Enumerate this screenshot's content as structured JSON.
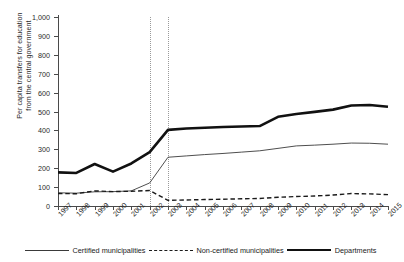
{
  "figure": {
    "title_cropped": "",
    "ylabel_line1": "Per capita transfers for education",
    "ylabel_line2": "from the central government"
  },
  "legend": {
    "items": [
      {
        "label": "Certified municipalities",
        "style": "thin-solid",
        "color": "#3a3a3a"
      },
      {
        "label": "Non-certified municipalities",
        "style": "dashed",
        "color": "#1a1a1a"
      },
      {
        "label": "Departments",
        "style": "thick-solid",
        "color": "#111111"
      }
    ]
  },
  "chart_data": {
    "type": "line",
    "title": "",
    "xlabel": "",
    "ylabel": "Per capita transfers for education from the central government",
    "x": [
      "1997",
      "1998",
      "1999",
      "2000",
      "2001",
      "2002",
      "2003",
      "2004",
      "2005",
      "2006",
      "2007",
      "2008",
      "2009",
      "2010",
      "2011",
      "2012",
      "2013",
      "2014",
      "2015"
    ],
    "xlim": [
      1997,
      2015
    ],
    "ylim": [
      0,
      1000
    ],
    "yticks": [
      0,
      100,
      200,
      300,
      400,
      500,
      600,
      700,
      800,
      900,
      1000
    ],
    "ytick_labels": [
      "0",
      "100",
      "200",
      "300",
      "400",
      "500",
      "600",
      "700",
      "800",
      "900",
      "1,000"
    ],
    "grid": false,
    "legend_position": "bottom",
    "annotations": [
      {
        "type": "vline",
        "x": "2002",
        "style": "dotted"
      },
      {
        "type": "vline",
        "x": "2003",
        "style": "dotted"
      }
    ],
    "series": [
      {
        "name": "Certified municipalities",
        "style": "thin-solid",
        "values": [
          70,
          68,
          75,
          76,
          80,
          122,
          258,
          265,
          272,
          278,
          285,
          292,
          305,
          318,
          322,
          327,
          333,
          332,
          327
        ]
      },
      {
        "name": "Non-certified municipalities",
        "style": "dashed",
        "values": [
          66,
          65,
          80,
          76,
          78,
          82,
          30,
          32,
          34,
          36,
          38,
          40,
          46,
          50,
          53,
          58,
          66,
          64,
          60
        ]
      },
      {
        "name": "Departments",
        "style": "thick-solid",
        "values": [
          178,
          175,
          222,
          182,
          225,
          285,
          403,
          410,
          414,
          418,
          421,
          423,
          472,
          487,
          498,
          510,
          532,
          534,
          525
        ]
      }
    ]
  }
}
